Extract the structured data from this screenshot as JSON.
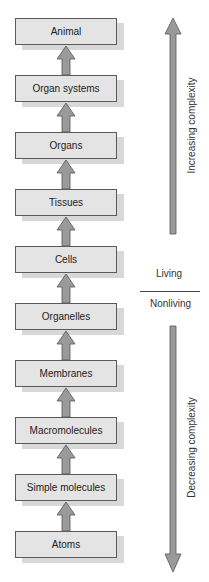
{
  "levels": [
    {
      "label": "Animal"
    },
    {
      "label": "Organ systems"
    },
    {
      "label": "Organs"
    },
    {
      "label": "Tissues"
    },
    {
      "label": "Cells"
    },
    {
      "label": "Organelles"
    },
    {
      "label": "Membranes"
    },
    {
      "label": "Macromolecules"
    },
    {
      "label": "Simple molecules"
    },
    {
      "label": "Atoms"
    }
  ],
  "right": {
    "up_label": "Increasing complexity",
    "down_label": "Decreasing complexity",
    "living": "Living",
    "nonliving": "Nonliving"
  },
  "colors": {
    "box_fill": "#e4e4e4",
    "box_border": "#5a5a5a",
    "arrow_fill": "#9a9a9a"
  }
}
